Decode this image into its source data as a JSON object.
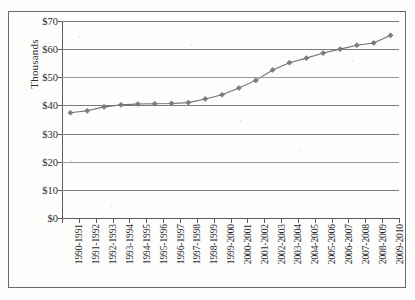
{
  "chart_data": {
    "type": "line",
    "title": "",
    "xlabel": "",
    "ylabel": "Thousands",
    "ylim": [
      0,
      70
    ],
    "ytick_step": 10,
    "grid": true,
    "legend": false,
    "y_tick_labels": [
      "$0",
      "$10",
      "$20",
      "$30",
      "$40",
      "$50",
      "$60",
      "$70"
    ],
    "y_tick_values": [
      0,
      10,
      20,
      30,
      40,
      50,
      60,
      70
    ],
    "categories": [
      "1990-1991",
      "1991-1992",
      "1992-1993",
      "1993-1994",
      "1994-1995",
      "1995-1996",
      "1996-1997",
      "1997-1998",
      "1998-1999",
      "1999-2000",
      "2000-2001",
      "2001-2002",
      "2002-2003",
      "2003-2004",
      "2004-2005",
      "2005-2006",
      "2006-2007",
      "2007-2008",
      "2008-2009",
      "2009-2010"
    ],
    "values": [
      37.4,
      38.1,
      39.5,
      40.2,
      40.5,
      40.6,
      40.7,
      41.0,
      42.3,
      43.8,
      46.2,
      48.9,
      52.6,
      55.2,
      56.8,
      58.6,
      60.0,
      61.4,
      62.2,
      64.9
    ],
    "series_name": "Average salary",
    "marker": "diamond",
    "line_color": "#6f6f78",
    "marker_color": "#7b7b86"
  },
  "axis": {
    "y_title": "Thousands"
  }
}
